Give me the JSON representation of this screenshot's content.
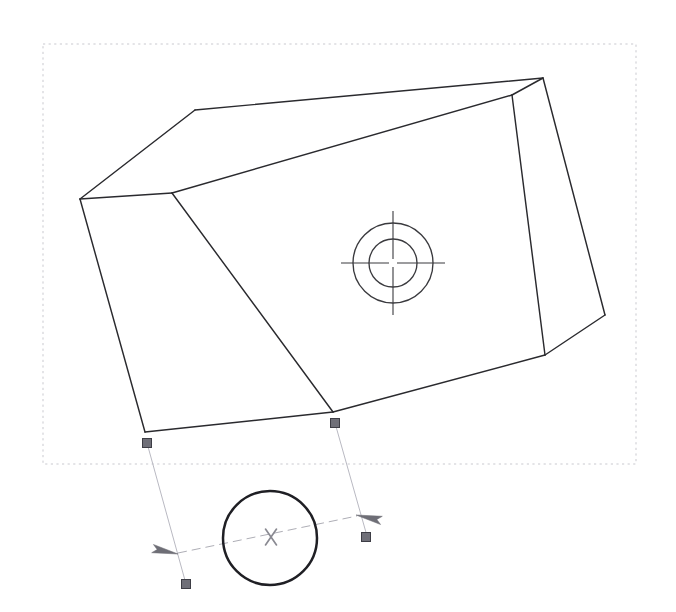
{
  "app": {
    "title": "CAD Drawing Canvas",
    "background_color": "#ffffff",
    "width": 676,
    "height": 612
  },
  "colors": {
    "edge_stroke": "#2a2a2e",
    "hole_stroke": "#3a3a3e",
    "selection_box": "#c9c9cf",
    "dimension_line": "#aeaeb6",
    "grip_handle_fill": "#6f6f78",
    "grip_handle_stroke": "#3d3d45",
    "dim_circle": "#1f1f24",
    "cursor_marker": "#8a8a92"
  },
  "selection_box": {
    "name": "dashed-selection-boundary",
    "x": 43,
    "y": 44,
    "width": 593,
    "height": 420,
    "dash": "2.2 3.4"
  },
  "solid": {
    "name": "extruded-prism-body",
    "vertices": {
      "top_left_back": [
        195,
        110
      ],
      "top_right_back": [
        543,
        78
      ],
      "left_upper": [
        80,
        199
      ],
      "front_top_left": [
        172,
        193
      ],
      "front_bottom_left": [
        145,
        432
      ],
      "front_bottom_right": [
        333,
        412
      ],
      "right_inner_top": [
        512,
        95
      ],
      "right_inner_bottom": [
        545,
        355
      ],
      "right_outer_bottom": [
        605,
        315
      ],
      "left_lower": [
        80,
        199
      ]
    },
    "faces": [
      {
        "name": "top-chamfer-face",
        "points": "195,110 543,78 512,95 172,193 80,199"
      },
      {
        "name": "front-large-face",
        "points": "172,193 512,95 545,355 333,412 145,432"
      },
      {
        "name": "left-side-face",
        "points": "80,199 172,193 145,432"
      },
      {
        "name": "right-side-face",
        "points": "543,78 605,315 545,355 512,95"
      }
    ],
    "edges": [
      {
        "name": "edge-top-back",
        "from": [
          195,
          110
        ],
        "to": [
          543,
          78
        ]
      },
      {
        "name": "edge-top-left-slope",
        "from": [
          195,
          110
        ],
        "to": [
          80,
          199
        ]
      },
      {
        "name": "edge-top-front-ridge",
        "from": [
          172,
          193
        ],
        "to": [
          512,
          95
        ]
      },
      {
        "name": "edge-left-chamfer",
        "from": [
          80,
          199
        ],
        "to": [
          172,
          193
        ]
      },
      {
        "name": "edge-left-vertical",
        "from": [
          80,
          199
        ],
        "to": [
          145,
          432
        ]
      },
      {
        "name": "edge-front-left-vertical",
        "from": [
          172,
          193
        ],
        "to": [
          333,
          412
        ]
      },
      {
        "name": "edge-bottom-front",
        "from": [
          145,
          432
        ],
        "to": [
          333,
          412
        ]
      },
      {
        "name": "edge-bottom-right",
        "from": [
          333,
          412
        ],
        "to": [
          545,
          355
        ]
      },
      {
        "name": "edge-right-inner-vertical",
        "from": [
          512,
          95
        ],
        "to": [
          545,
          355
        ]
      },
      {
        "name": "edge-right-outer",
        "from": [
          543,
          78
        ],
        "to": [
          605,
          315
        ]
      },
      {
        "name": "edge-right-bottom-chamfer",
        "from": [
          605,
          315
        ],
        "to": [
          545,
          355
        ]
      },
      {
        "name": "edge-top-right-corner",
        "from": [
          543,
          78
        ],
        "to": [
          512,
          95
        ]
      }
    ]
  },
  "hole": {
    "name": "counterbore-hole",
    "center": [
      393,
      263
    ],
    "outer_radius": 40,
    "inner_radius": 24,
    "centerline_half_length": 52,
    "centerline_gap": 4
  },
  "dimension": {
    "name": "linear-dimension-annotation",
    "extension_lines": [
      {
        "name": "extension-line-left",
        "from": [
          147,
          443
        ],
        "to": [
          186,
          584
        ]
      },
      {
        "name": "extension-line-right",
        "from": [
          335,
          423
        ],
        "to": [
          367,
          536
        ]
      }
    ],
    "dim_line": {
      "from": [
        178,
        553
      ],
      "to": [
        357,
        516
      ]
    },
    "arrows": [
      {
        "name": "dim-arrow-left",
        "tip": [
          178,
          554
        ],
        "angle_deg": 192
      },
      {
        "name": "dim-arrow-right",
        "tip": [
          356,
          515
        ],
        "angle_deg": 12
      }
    ],
    "grips": [
      {
        "name": "grip-origin-left",
        "x": 147,
        "y": 443
      },
      {
        "name": "grip-origin-right",
        "x": 335,
        "y": 423
      },
      {
        "name": "grip-end-left",
        "x": 186,
        "y": 584
      },
      {
        "name": "grip-end-right",
        "x": 366,
        "y": 537
      }
    ],
    "grip_size": 9,
    "text_circle": {
      "name": "dimension-text-circle",
      "center": [
        270,
        538
      ],
      "radius": 47
    },
    "cursor_marker": {
      "name": "x-cursor-marker",
      "center": [
        271,
        537
      ],
      "size": 11,
      "label": "X"
    }
  }
}
